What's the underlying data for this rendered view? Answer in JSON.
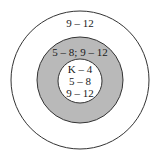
{
  "diagram": {
    "type": "concentric-circles",
    "rings": [
      {
        "name": "outer",
        "label": "9 – 12",
        "fill": "#ffffff",
        "stroke": "#333333"
      },
      {
        "name": "middle",
        "label": "5 – 8; 9 – 12",
        "fill": "#b9b9b9",
        "stroke": "#333333"
      },
      {
        "name": "inner",
        "lines": [
          "K – 4",
          "5 – 8",
          "9 – 12"
        ],
        "fill": "#ffffff",
        "stroke": "#333333"
      }
    ]
  }
}
